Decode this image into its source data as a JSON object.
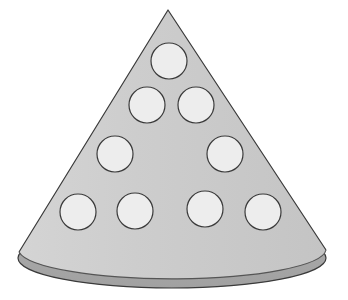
{
  "figure": {
    "shape_type": "cone",
    "canvas": {
      "width": 348,
      "height": 300,
      "background": "#ffffff"
    },
    "colors": {
      "cone_body_fill": "#c9c9c9",
      "cone_body_fill_light": "#d2d2d2",
      "base_ellipse_fill": "#a6a6a6",
      "circle_fill": "#ededed",
      "outline": "#3a3a3a",
      "outline_soft": "#555555"
    },
    "stroke_width": 1.2,
    "apex": {
      "x": 168,
      "y": 10
    },
    "base_left": {
      "x": 19,
      "y": 252
    },
    "base_right": {
      "x": 326,
      "y": 250
    },
    "base_ellipse": {
      "cx": 172,
      "cy": 258,
      "rx": 154,
      "ry": 30
    },
    "circle_radius": 18,
    "circle_count": 11,
    "circles": [
      {
        "id": "circle-r1-c1",
        "row": 1,
        "index": 1,
        "cx": 169,
        "cy": 61,
        "r": 18
      },
      {
        "id": "circle-r2-c1",
        "row": 2,
        "index": 1,
        "cx": 147,
        "cy": 105,
        "r": 18
      },
      {
        "id": "circle-r2-c2",
        "row": 2,
        "index": 2,
        "cx": 196,
        "cy": 105,
        "r": 18
      },
      {
        "id": "circle-r3-c1",
        "row": 3,
        "index": 1,
        "cx": 115,
        "cy": 154,
        "r": 18
      },
      {
        "id": "circle-r3-c2",
        "row": 3,
        "index": 2,
        "cx": 225,
        "cy": 154,
        "r": 18
      },
      {
        "id": "circle-r4-c1",
        "row": 4,
        "index": 1,
        "cx": 78,
        "cy": 212,
        "r": 18
      },
      {
        "id": "circle-r4-c2",
        "row": 4,
        "index": 2,
        "cx": 135,
        "cy": 211,
        "r": 18
      },
      {
        "id": "circle-r4-c3",
        "row": 4,
        "index": 3,
        "cx": 205,
        "cy": 209,
        "r": 18
      },
      {
        "id": "circle-r4-c4",
        "row": 4,
        "index": 4,
        "cx": 263,
        "cy": 212,
        "r": 18
      },
      {
        "id": "circle-extra-1",
        "row": 0,
        "index": 0,
        "cx": 0,
        "cy": 0,
        "r": 0
      },
      {
        "id": "circle-extra-2",
        "row": 0,
        "index": 0,
        "cx": 0,
        "cy": 0,
        "r": 0
      }
    ]
  }
}
